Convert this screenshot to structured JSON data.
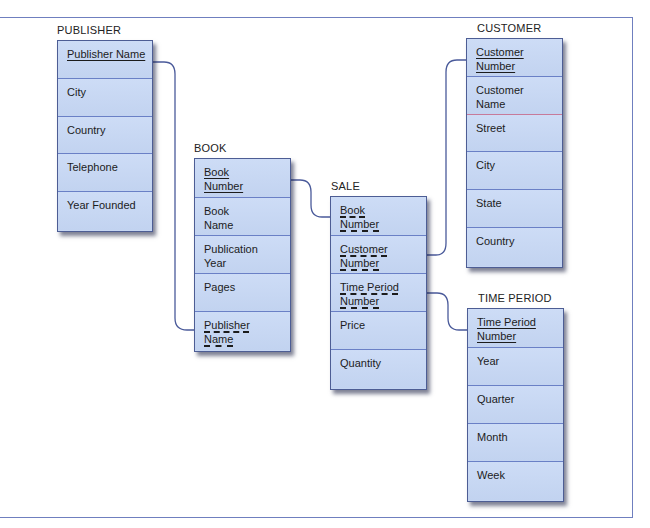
{
  "diagram": {
    "type": "entity-relationship",
    "colors": {
      "entity_fill": "#c6d6f2",
      "entity_border": "#4d5d94",
      "line": "#4a5a9a",
      "frame": "#6f7fbf"
    },
    "entities": {
      "publisher": {
        "title": "PUBLISHER",
        "attributes": [
          {
            "label": "Publisher Name",
            "key": "primary"
          },
          {
            "label": "City",
            "key": "none"
          },
          {
            "label": "Country",
            "key": "none"
          },
          {
            "label": "Telephone",
            "key": "none"
          },
          {
            "label": "Year Founded",
            "key": "none"
          }
        ]
      },
      "book": {
        "title": "BOOK",
        "attributes": [
          {
            "label": "Book Number",
            "key": "primary"
          },
          {
            "label": "Book Name",
            "key": "none"
          },
          {
            "label": "Publication Year",
            "key": "none"
          },
          {
            "label": "Pages",
            "key": "none"
          },
          {
            "label": "Publisher Name",
            "key": "foreign"
          }
        ]
      },
      "sale": {
        "title": "SALE",
        "attributes": [
          {
            "label": "Book Number",
            "key": "foreign"
          },
          {
            "label": "Customer Number",
            "key": "foreign"
          },
          {
            "label": "Time Period Number",
            "key": "foreign"
          },
          {
            "label": "Price",
            "key": "none"
          },
          {
            "label": "Quantity",
            "key": "none"
          }
        ]
      },
      "customer": {
        "title": "CUSTOMER",
        "attributes": [
          {
            "label": "Customer Number",
            "key": "primary"
          },
          {
            "label": "Customer Name",
            "key": "none"
          },
          {
            "label": "Street",
            "key": "none"
          },
          {
            "label": "City",
            "key": "none"
          },
          {
            "label": "State",
            "key": "none"
          },
          {
            "label": "Country",
            "key": "none"
          }
        ]
      },
      "time_period": {
        "title": "TIME PERIOD",
        "attributes": [
          {
            "label": "Time Period Number",
            "key": "primary"
          },
          {
            "label": "Year",
            "key": "none"
          },
          {
            "label": "Quarter",
            "key": "none"
          },
          {
            "label": "Month",
            "key": "none"
          },
          {
            "label": "Week",
            "key": "none"
          }
        ]
      }
    },
    "relationships": [
      {
        "from": "PUBLISHER.Publisher Name",
        "to": "BOOK.Publisher Name"
      },
      {
        "from": "BOOK.Book Number",
        "to": "SALE.Book Number"
      },
      {
        "from": "CUSTOMER.Customer Number",
        "to": "SALE.Customer Number"
      },
      {
        "from": "TIME PERIOD.Time Period Number",
        "to": "SALE.Time Period Number"
      }
    ]
  }
}
